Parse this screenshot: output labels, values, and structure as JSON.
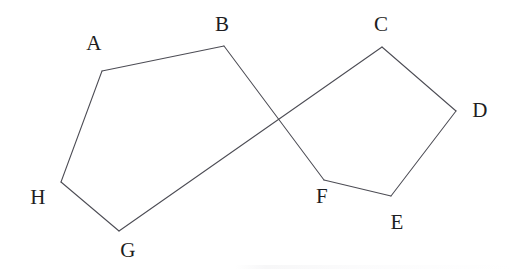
{
  "figure": {
    "type": "geometry-diagram",
    "canvas": {
      "width": 511,
      "height": 269
    },
    "background_color": "#ffffff",
    "stroke_color": "#4c4c54",
    "label_color": "#1d1d21",
    "vertices": [
      {
        "id": "A",
        "label": "A",
        "x": 102,
        "y": 71,
        "label_x": 94,
        "label_y": 43
      },
      {
        "id": "B",
        "label": "B",
        "x": 224,
        "y": 46,
        "label_x": 222,
        "label_y": 24
      },
      {
        "id": "C",
        "label": "C",
        "x": 382,
        "y": 47,
        "label_x": 381,
        "label_y": 24
      },
      {
        "id": "D",
        "label": "D",
        "x": 456,
        "y": 111,
        "label_x": 480,
        "label_y": 110
      },
      {
        "id": "E",
        "label": "E",
        "x": 391,
        "y": 196,
        "label_x": 397,
        "label_y": 222
      },
      {
        "id": "F",
        "label": "F",
        "x": 324,
        "y": 180,
        "label_x": 322,
        "label_y": 196
      },
      {
        "id": "G",
        "label": "G",
        "x": 119,
        "y": 231,
        "label_x": 128,
        "label_y": 250
      },
      {
        "id": "H",
        "label": "H",
        "x": 61,
        "y": 182,
        "label_x": 38,
        "label_y": 197
      }
    ],
    "edges": [
      {
        "id": "A-B",
        "from": "A",
        "to": "B"
      },
      {
        "id": "B-F",
        "from": "B",
        "to": "F"
      },
      {
        "id": "F-E",
        "from": "F",
        "to": "E"
      },
      {
        "id": "E-D",
        "from": "E",
        "to": "D"
      },
      {
        "id": "D-C",
        "from": "D",
        "to": "C"
      },
      {
        "id": "C-G",
        "from": "C",
        "to": "G"
      },
      {
        "id": "G-H",
        "from": "G",
        "to": "H"
      },
      {
        "id": "H-A",
        "from": "H",
        "to": "A"
      }
    ],
    "intersections": [
      {
        "id": "B-F_x_C-G",
        "x": 278,
        "y": 119
      }
    ]
  }
}
